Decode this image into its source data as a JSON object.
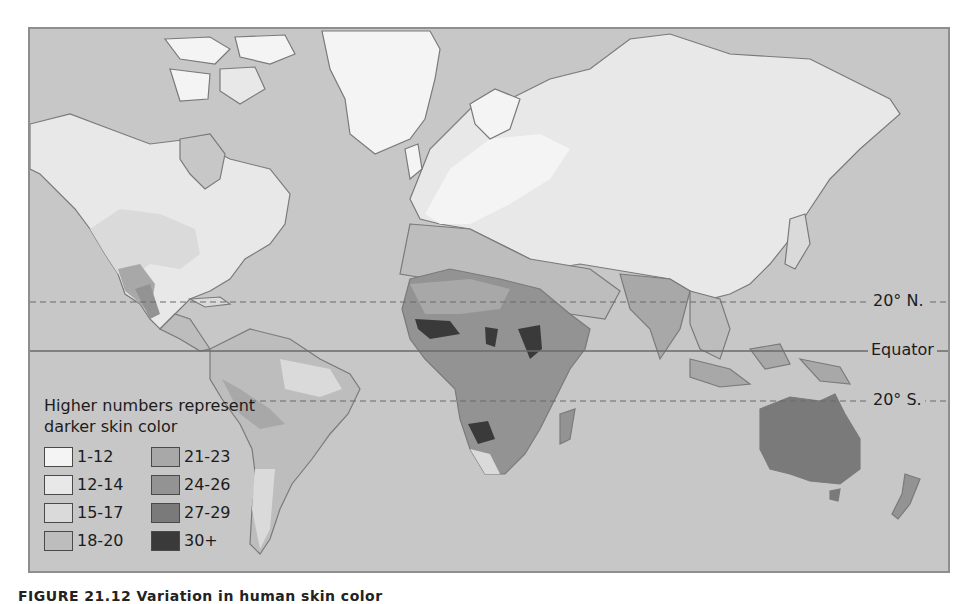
{
  "map": {
    "title": "Variation in human skin color",
    "ocean_color": "#c7c7c7",
    "border_color": "#8e8e8e",
    "latitude_lines": [
      {
        "label": "20° N.",
        "style": "dashed",
        "y": 273
      },
      {
        "label": "Equator",
        "style": "solid",
        "y": 322
      },
      {
        "label": "20° S.",
        "style": "dashed",
        "y": 372
      }
    ],
    "regions": [
      {
        "name": "Greenland",
        "value_range": "1-12"
      },
      {
        "name": "Northern Europe",
        "value_range": "1-12"
      },
      {
        "name": "Northern North America",
        "value_range": "12-14"
      },
      {
        "name": "Northern Asia",
        "value_range": "12-14"
      },
      {
        "name": "Southern USA / Mexico",
        "value_range": "18-20"
      },
      {
        "name": "South America",
        "value_range": "18-20"
      },
      {
        "name": "North Africa / Middle East",
        "value_range": "21-23"
      },
      {
        "name": "India / South Asia",
        "value_range": "21-23"
      },
      {
        "name": "Central Africa",
        "value_range": "24-26"
      },
      {
        "name": "Australia",
        "value_range": "27-29"
      },
      {
        "name": "West & Central Africa patches",
        "value_range": "30+"
      }
    ]
  },
  "legend": {
    "title": "Higher numbers represent darker skin color",
    "items": [
      {
        "label": "1-12",
        "color": "#f4f4f4"
      },
      {
        "label": "12-14",
        "color": "#e8e8e8"
      },
      {
        "label": "15-17",
        "color": "#dadada"
      },
      {
        "label": "18-20",
        "color": "#bdbdbd"
      },
      {
        "label": "21-23",
        "color": "#a8a8a8"
      },
      {
        "label": "24-26",
        "color": "#939393"
      },
      {
        "label": "27-29",
        "color": "#7a7a7a"
      },
      {
        "label": "30+",
        "color": "#3a3a3a"
      }
    ]
  },
  "caption": {
    "text": "FIGURE 21.12  Variation in human skin color"
  }
}
